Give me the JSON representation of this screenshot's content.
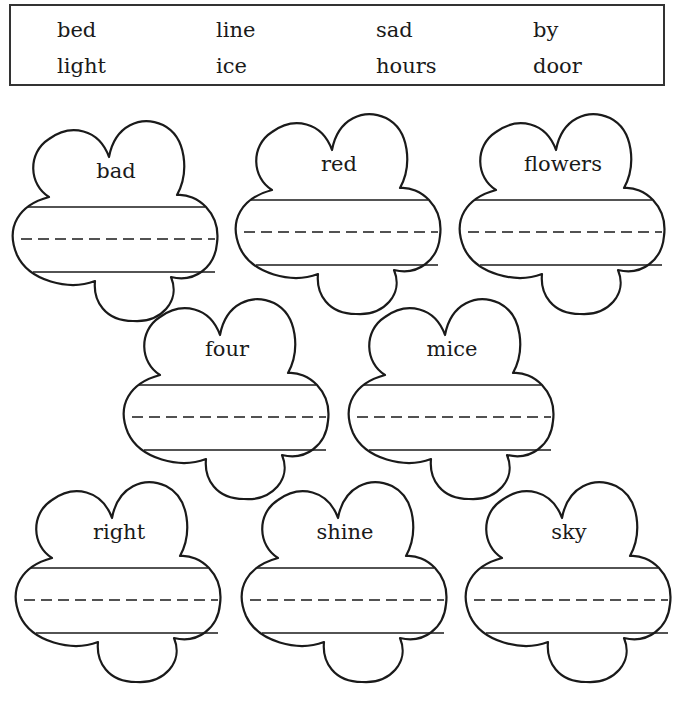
{
  "word_bank": {
    "rows": [
      [
        "bed",
        "line",
        "sad",
        "by"
      ],
      [
        "light",
        "ice",
        "hours",
        "door"
      ]
    ]
  },
  "flowers": [
    {
      "word": "bad"
    },
    {
      "word": "red"
    },
    {
      "word": "flowers"
    },
    {
      "word": "four"
    },
    {
      "word": "mice"
    },
    {
      "word": "right"
    },
    {
      "word": "shine"
    },
    {
      "word": "sky"
    }
  ],
  "colors": {
    "ink": "#1a1a1a",
    "background": "#ffffff"
  }
}
